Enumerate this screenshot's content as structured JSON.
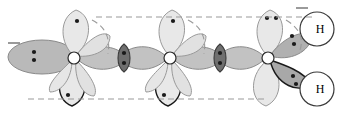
{
  "figure": {
    "type": "orbital-overlap-diagram",
    "title": "",
    "background": "#ffffff",
    "width": 344,
    "height": 117
  },
  "palette": {
    "lobe_light": "#e8e8e8",
    "lobe_light_stroke": "#9a9a9a",
    "lobe_gray": "#c2c2c2",
    "lobe_gray_stroke": "#8a8a8a",
    "lobe_dark": "#9e9e9e",
    "overlap_dark": "#6f6f6f",
    "overlap_stroke": "#3a3a3a",
    "dot": "#1a1a1a",
    "dash": "#9a9a9a",
    "atom_node_fill": "#ffffff",
    "atom_node_stroke": "#2b2b2b",
    "h_circle_fill": "#ffffff",
    "h_circle_stroke": "#3a3a3a",
    "bold_outline": "#1a1a1a",
    "text": "#000000"
  },
  "atoms": [
    {
      "name": "carbon-1",
      "cx": 74,
      "cy": 58,
      "label": ""
    },
    {
      "name": "carbon-2",
      "cx": 170,
      "cy": 58,
      "label": ""
    },
    {
      "name": "carbon-3",
      "cx": 268,
      "cy": 58,
      "label": ""
    }
  ],
  "hydrogens": [
    {
      "name": "hydrogen-top-right",
      "label": "H",
      "cx": 317,
      "cy": 29,
      "r": 17
    },
    {
      "name": "hydrogen-bottom-right",
      "label": "H",
      "cx": 317,
      "cy": 89,
      "r": 17
    }
  ],
  "lone_pairs": [
    {
      "name": "lone-pair-left-terminal",
      "x": 34,
      "y": 56,
      "count": 2,
      "orientation": "vertical"
    },
    {
      "name": "electron-pair-bond-1",
      "x": 124,
      "y": 58,
      "count": 2,
      "orientation": "vertical"
    },
    {
      "name": "electron-pair-bond-2",
      "x": 220,
      "y": 58,
      "count": 2,
      "orientation": "vertical"
    },
    {
      "name": "electron-pair-h-top",
      "x": 292,
      "y": 40,
      "count": 2,
      "orientation": "diagonal"
    },
    {
      "name": "electron-pair-h-bottom",
      "x": 292,
      "y": 80,
      "count": 2,
      "orientation": "diagonal"
    }
  ],
  "single_electrons": [
    {
      "name": "electron-c1-top",
      "x": 86,
      "y": 18
    },
    {
      "name": "electron-c1-bottom",
      "x": 66,
      "y": 99
    },
    {
      "name": "electron-c2-top",
      "x": 182,
      "y": 18
    },
    {
      "name": "electron-c2-bottom",
      "x": 162,
      "y": 99
    }
  ],
  "electron_pairs_vertical": [
    {
      "name": "electron-pair-c3-top",
      "x": 280,
      "y": 16,
      "count": 2
    }
  ],
  "guidelines": [
    {
      "name": "dashed-guide-top",
      "x1": 96,
      "y1": 17,
      "x2": 312,
      "y2": 17
    },
    {
      "name": "dashed-guide-bottom",
      "x1": 28,
      "y1": 99,
      "x2": 268,
      "y2": 99
    },
    {
      "name": "dash-tick-left",
      "x1": 8,
      "y1": 43,
      "x2": 20,
      "y2": 43
    },
    {
      "name": "dash-tick-top-right",
      "x1": 296,
      "y1": 8,
      "x2": 308,
      "y2": 8
    }
  ],
  "arcs": [
    {
      "name": "dashed-arc-c1",
      "d": "M 92 20 Q 112 30 108 54"
    },
    {
      "name": "dashed-arc-c2",
      "d": "M 188 20 Q 208 30 204 54"
    },
    {
      "name": "dashed-arc-c3",
      "d": "M 286 20 Q 306 32 300 50"
    }
  ],
  "legend": {
    "description": "Three-carbon chain with overlapping hybrid orbitals and two terminal hydrogen atoms",
    "visible_text": [
      "H",
      "H"
    ]
  }
}
